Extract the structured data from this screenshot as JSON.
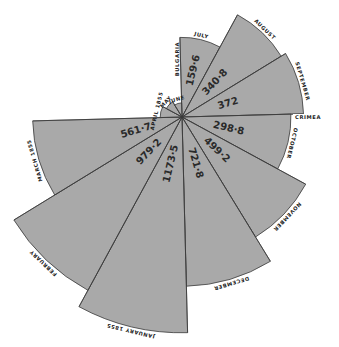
{
  "chart_data": {
    "type": "polar-area",
    "title": "",
    "center": [
      182,
      117
    ],
    "scale_k": 6.3,
    "start_angle_deg": -91.5,
    "sector_deg": 30,
    "categories": [
      "July",
      "August",
      "September",
      "October",
      "November",
      "December",
      "January 1855",
      "February",
      "March 1855",
      "April 1855",
      "May",
      "June"
    ],
    "values": [
      159.6,
      340.8,
      372,
      298.8,
      499.2,
      721.8,
      1173.5,
      979.2,
      561.7,
      12,
      8,
      5
    ],
    "value_labels": [
      "159·6",
      "340·8",
      "372",
      "298·8",
      "499·2",
      "721·8",
      "1173·5",
      "979·2",
      "561·7",
      "",
      "",
      ""
    ],
    "month_labels": [
      "JULY",
      "AUGUST",
      "SEPTEMBER",
      "OCTOBER",
      "NOVEMBER",
      "DECEMBER",
      "JANUARY 1855",
      "FEBRUARY",
      "MARCH 1855",
      "APRIL 1855",
      "MAY",
      "JUNE"
    ],
    "annotations": [
      {
        "text": "BULGARIA",
        "angle_deg": -91.5,
        "note": "along upward vertical boundary"
      },
      {
        "text": "CRIMEA",
        "angle_deg": -1.5,
        "note": "along rightward horizontal boundary"
      }
    ],
    "fill_color": "#a9a9a9",
    "stroke_color": "#3a3a3a"
  }
}
